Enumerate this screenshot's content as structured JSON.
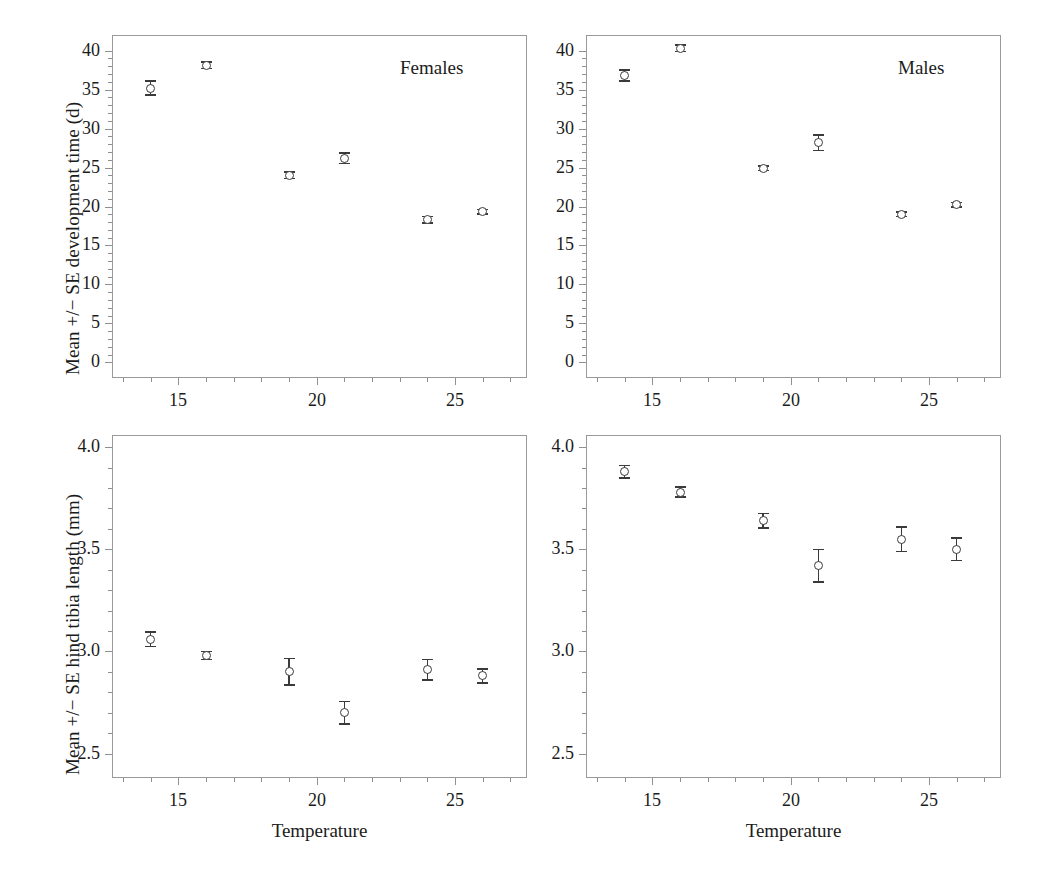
{
  "figure": {
    "background": "#ffffff",
    "marker_color": "#3a3a3a",
    "frame_color": "#9a9a9a"
  },
  "panels": {
    "top_left": {
      "title": "Females",
      "ylabel": "Mean +/− SE development time (d)",
      "xlabel": ""
    },
    "top_right": {
      "title": "Males",
      "ylabel": "",
      "xlabel": ""
    },
    "bottom_left": {
      "title": "",
      "ylabel": "Mean +/− SE hind tibia length (mm)",
      "xlabel": "Temperature"
    },
    "bottom_right": {
      "title": "",
      "ylabel": "",
      "xlabel": "Temperature"
    }
  },
  "axes": {
    "x_ticks": [
      "15",
      "20",
      "25"
    ],
    "y_ticks_time": [
      "0",
      "5",
      "10",
      "15",
      "20",
      "25",
      "30",
      "35",
      "40"
    ],
    "y_ticks_tibia": [
      "2.5",
      "3.0",
      "3.5",
      "4.0"
    ]
  },
  "chart_data": [
    {
      "type": "scatter",
      "title": "Females",
      "xlabel": "Temperature",
      "ylabel": "Mean +/− SE development time (d)",
      "xlim": [
        12.6,
        27.6
      ],
      "ylim": [
        -2.0,
        42.0
      ],
      "xticks": [
        15,
        20,
        25
      ],
      "yticks": [
        0,
        5,
        10,
        15,
        20,
        25,
        30,
        35,
        40
      ],
      "grid": false,
      "legend": "none",
      "errorbars": "SE",
      "x": [
        14,
        16,
        19,
        21,
        24,
        26
      ],
      "values": [
        35.2,
        38.1,
        24.0,
        26.2,
        18.3,
        19.3
      ],
      "error": [
        0.9,
        0.4,
        0.4,
        0.7,
        0.4,
        0.3
      ]
    },
    {
      "type": "scatter",
      "title": "Males",
      "xlabel": "Temperature",
      "ylabel": "Mean +/− SE development time (d)",
      "xlim": [
        12.6,
        27.6
      ],
      "ylim": [
        -2.0,
        42.0
      ],
      "xticks": [
        15,
        20,
        25
      ],
      "yticks": [
        0,
        5,
        10,
        15,
        20,
        25,
        30,
        35,
        40
      ],
      "grid": false,
      "legend": "none",
      "errorbars": "SE",
      "x": [
        14,
        16,
        19,
        21,
        24,
        26
      ],
      "values": [
        36.8,
        40.3,
        24.9,
        28.2,
        19.0,
        20.2
      ],
      "error": [
        0.7,
        0.4,
        0.3,
        1.0,
        0.3,
        0.3
      ]
    },
    {
      "type": "scatter",
      "title": "Females",
      "xlabel": "Temperature",
      "ylabel": "Mean +/− SE hind tibia length (mm)",
      "xlim": [
        12.6,
        27.6
      ],
      "ylim": [
        2.38,
        4.06
      ],
      "xticks": [
        15,
        20,
        25
      ],
      "yticks": [
        2.5,
        3.0,
        3.5,
        4.0
      ],
      "grid": false,
      "legend": "none",
      "errorbars": "SE",
      "x": [
        14,
        16,
        19,
        21,
        24,
        26
      ],
      "values": [
        3.06,
        2.98,
        2.9,
        2.7,
        2.91,
        2.88
      ],
      "error": [
        0.035,
        0.02,
        0.065,
        0.055,
        0.05,
        0.035
      ]
    },
    {
      "type": "scatter",
      "title": "Males",
      "xlabel": "Temperature",
      "ylabel": "Mean +/− SE hind tibia length (mm)",
      "xlim": [
        12.6,
        27.6
      ],
      "ylim": [
        2.38,
        4.06
      ],
      "xticks": [
        15,
        20,
        25
      ],
      "yticks": [
        2.5,
        3.0,
        3.5,
        4.0
      ],
      "grid": false,
      "legend": "none",
      "errorbars": "SE",
      "x": [
        14,
        16,
        19,
        21,
        24,
        26
      ],
      "values": [
        3.88,
        3.78,
        3.64,
        3.42,
        3.55,
        3.5
      ],
      "error": [
        0.03,
        0.025,
        0.035,
        0.08,
        0.06,
        0.055
      ]
    }
  ]
}
